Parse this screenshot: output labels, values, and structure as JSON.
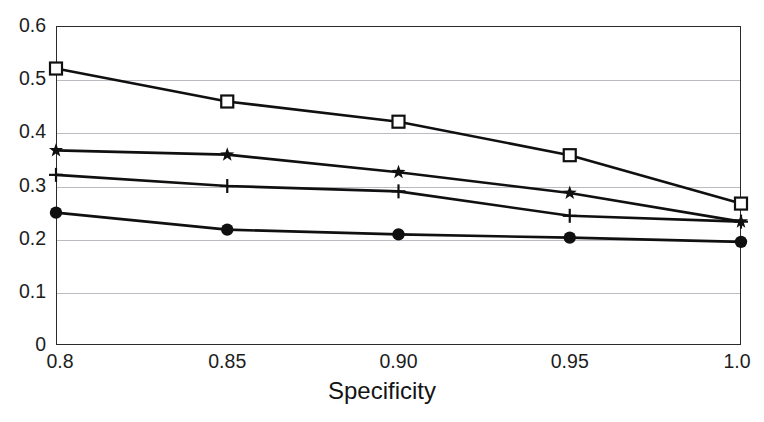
{
  "chart_data": {
    "type": "line",
    "title": "",
    "xlabel": "Specificity",
    "ylabel": "",
    "x": [
      0.8,
      0.85,
      0.9,
      0.95,
      1.0
    ],
    "xtick_labels": [
      "0.8",
      "0.85",
      "0.90",
      "0.95",
      "1.0"
    ],
    "ytick_labels": [
      "0",
      "0.1",
      "0.2",
      "0.3",
      "0.4",
      "0.5",
      "0.6"
    ],
    "ytick_values": [
      0,
      0.1,
      0.2,
      0.3,
      0.4,
      0.5,
      0.6
    ],
    "xlim": [
      0.8,
      1.0
    ],
    "ylim": [
      0,
      0.6
    ],
    "grid": "horizontal",
    "legend": "none",
    "line_color": "#101010",
    "grid_color": "#b9bcc0",
    "axis_color": "#2b2b2b",
    "series": [
      {
        "name": "series-open-square",
        "marker": "open-square",
        "values": [
          0.52,
          0.458,
          0.42,
          0.357,
          0.266
        ]
      },
      {
        "name": "series-star",
        "marker": "star",
        "values": [
          0.366,
          0.358,
          0.325,
          0.286,
          0.232
        ]
      },
      {
        "name": "series-plus",
        "marker": "plus",
        "values": [
          0.32,
          0.299,
          0.289,
          0.243,
          0.232
        ]
      },
      {
        "name": "series-filled-circle",
        "marker": "filled-circle",
        "values": [
          0.249,
          0.217,
          0.208,
          0.202,
          0.194
        ]
      }
    ]
  },
  "axes": {
    "x_title": "Specificity"
  }
}
